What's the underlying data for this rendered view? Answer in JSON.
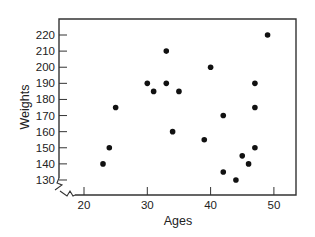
{
  "chart_data": {
    "type": "scatter",
    "title": "",
    "xlabel": "Ages",
    "ylabel": "Weights",
    "xlim": [
      17,
      54
    ],
    "ylim": [
      127,
      229
    ],
    "x_ticks": [
      20,
      30,
      40,
      50
    ],
    "y_ticks": [
      130,
      140,
      150,
      160,
      170,
      180,
      190,
      200,
      210,
      220
    ],
    "grid": false,
    "legend": null,
    "axis_break": "zigzag at origin (both axes)",
    "marker_color": "#111111",
    "points": [
      {
        "x": 23,
        "y": 140
      },
      {
        "x": 24,
        "y": 150
      },
      {
        "x": 25,
        "y": 175
      },
      {
        "x": 30,
        "y": 190
      },
      {
        "x": 31,
        "y": 185
      },
      {
        "x": 33,
        "y": 210
      },
      {
        "x": 33,
        "y": 190
      },
      {
        "x": 34,
        "y": 160
      },
      {
        "x": 35,
        "y": 185
      },
      {
        "x": 39,
        "y": 155
      },
      {
        "x": 40,
        "y": 200
      },
      {
        "x": 42,
        "y": 170
      },
      {
        "x": 42,
        "y": 135
      },
      {
        "x": 44,
        "y": 130
      },
      {
        "x": 45,
        "y": 145
      },
      {
        "x": 46,
        "y": 140
      },
      {
        "x": 47,
        "y": 150
      },
      {
        "x": 47,
        "y": 175
      },
      {
        "x": 47,
        "y": 190
      },
      {
        "x": 49,
        "y": 220
      }
    ]
  }
}
